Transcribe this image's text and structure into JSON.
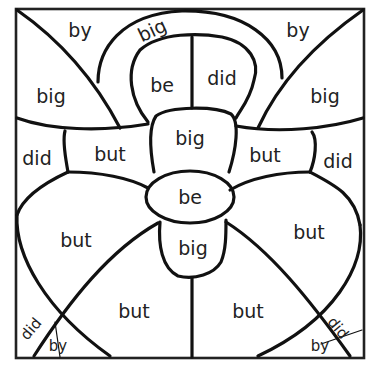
{
  "worksheet": {
    "frame_color": "#222222",
    "line_color": "#111111",
    "background_color": "#ffffff",
    "regions": [
      {
        "id": "top-left-corner",
        "word": "by",
        "x": 80,
        "y": 30,
        "rotate": 0
      },
      {
        "id": "top-arch",
        "word": "big",
        "x": 152,
        "y": 30,
        "rotate": -25
      },
      {
        "id": "top-right-corner",
        "word": "by",
        "x": 298,
        "y": 30,
        "rotate": 0
      },
      {
        "id": "upper-left-petal",
        "word": "big",
        "x": 51,
        "y": 96,
        "rotate": 0
      },
      {
        "id": "inner-left-loop",
        "word": "be",
        "x": 162,
        "y": 85,
        "rotate": 0
      },
      {
        "id": "inner-right-loop",
        "word": "did",
        "x": 222,
        "y": 78,
        "rotate": 0
      },
      {
        "id": "upper-right-petal",
        "word": "big",
        "x": 325,
        "y": 96,
        "rotate": 0
      },
      {
        "id": "left-edge-upper",
        "word": "did",
        "x": 37,
        "y": 158,
        "rotate": 0
      },
      {
        "id": "left-bow",
        "word": "but",
        "x": 110,
        "y": 154,
        "rotate": 0
      },
      {
        "id": "top-center-knot",
        "word": "big",
        "x": 190,
        "y": 138,
        "rotate": 0
      },
      {
        "id": "right-bow",
        "word": "but",
        "x": 265,
        "y": 155,
        "rotate": 0
      },
      {
        "id": "right-edge-upper",
        "word": "did",
        "x": 338,
        "y": 161,
        "rotate": 0
      },
      {
        "id": "center-knot",
        "word": "be",
        "x": 190,
        "y": 197,
        "rotate": 0
      },
      {
        "id": "lower-left-petal",
        "word": "but",
        "x": 76,
        "y": 240,
        "rotate": 0
      },
      {
        "id": "bottom-center-knot",
        "word": "big",
        "x": 193,
        "y": 248,
        "rotate": 0
      },
      {
        "id": "lower-right-petal",
        "word": "but",
        "x": 309,
        "y": 232,
        "rotate": 0
      },
      {
        "id": "bottom-left-petal",
        "word": "but",
        "x": 134,
        "y": 311,
        "rotate": 0
      },
      {
        "id": "bottom-right-petal",
        "word": "but",
        "x": 248,
        "y": 311,
        "rotate": 0
      },
      {
        "id": "bottom-left-corner-upper",
        "word": "did",
        "x": 31,
        "y": 329,
        "rotate": -50,
        "small": true
      },
      {
        "id": "bottom-left-corner-lower",
        "word": "by",
        "x": 58,
        "y": 346,
        "rotate": 0,
        "small": true
      },
      {
        "id": "bottom-right-corner-upper",
        "word": "did",
        "x": 338,
        "y": 328,
        "rotate": 50,
        "small": true
      },
      {
        "id": "bottom-right-corner-lower",
        "word": "by",
        "x": 320,
        "y": 346,
        "rotate": 0,
        "small": true
      }
    ]
  }
}
